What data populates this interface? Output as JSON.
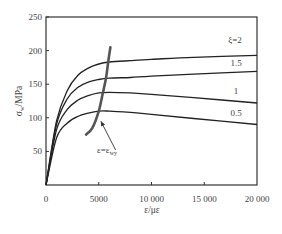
{
  "chart_data": {
    "type": "line",
    "title": "",
    "xlabel": "ε/με",
    "ylabel": "σw/MPa",
    "ylabel_main": "σ",
    "ylabel_sub": "w",
    "ylabel_unit": "/MPa",
    "xlim": [
      0,
      20000
    ],
    "ylim": [
      0,
      250
    ],
    "xticks": [
      0,
      5000,
      10000,
      15000,
      20000
    ],
    "xtick_labels": [
      "0",
      "5000",
      "10 000",
      "15 000",
      "20 000"
    ],
    "yticks": [
      50,
      100,
      150,
      200,
      250
    ],
    "ytick_labels": [
      "50",
      "100",
      "150",
      "200",
      "250"
    ],
    "y0_label": "0",
    "grid": false,
    "legend": "inline labels",
    "series": [
      {
        "name": "ξ=2",
        "label": "ξ=2",
        "x": [
          0,
          1000,
          2000,
          3000,
          4000,
          5000,
          6000,
          8000,
          10000,
          14000,
          20000
        ],
        "y": [
          0,
          95,
          140,
          163,
          174,
          180,
          183,
          185,
          187,
          190,
          193
        ]
      },
      {
        "name": "ξ=1.5",
        "label": "1.5",
        "x": [
          0,
          1000,
          2000,
          3000,
          4000,
          5000,
          6000,
          8000,
          10000,
          14000,
          20000
        ],
        "y": [
          0,
          90,
          128,
          145,
          153,
          157,
          159,
          160,
          162,
          165,
          169
        ]
      },
      {
        "name": "ξ=1",
        "label": "1",
        "x": [
          0,
          1000,
          2000,
          3000,
          4000,
          5000,
          6000,
          8000,
          10000,
          14000,
          20000
        ],
        "y": [
          0,
          82,
          112,
          126,
          133,
          137,
          138,
          137,
          135,
          130,
          122
        ]
      },
      {
        "name": "ξ=0.5",
        "label": "0.5",
        "x": [
          0,
          1000,
          2000,
          3000,
          4000,
          5000,
          6000,
          8000,
          10000,
          14000,
          20000
        ],
        "y": [
          0,
          70,
          92,
          102,
          107,
          110,
          110,
          108,
          105,
          99,
          90
        ]
      }
    ],
    "boundary_curve": {
      "name": "ε=ε_wy",
      "label_main": "ε=ε",
      "label_sub": "wy",
      "x": [
        3800,
        4400,
        5000,
        5400,
        5700,
        5900,
        6100
      ],
      "y": [
        75,
        85,
        110,
        138,
        160,
        183,
        205
      ]
    },
    "annotation_arrow": {
      "from": [
        6600,
        52
      ],
      "to": [
        5200,
        95
      ]
    }
  }
}
